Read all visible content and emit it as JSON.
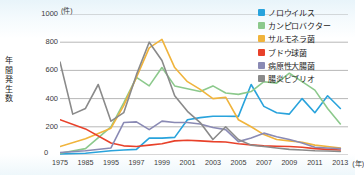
{
  "axes": {
    "y_unit": "(件)",
    "y_title": "年間発生数",
    "y_ticks": [
      "1000",
      "800",
      "600",
      "400",
      "200",
      "0"
    ],
    "x_unit": "(年)",
    "x_ticks": [
      "1975",
      "1985",
      "1995",
      "1997",
      "1999",
      "2001",
      "2003",
      "2005",
      "2007",
      "2009",
      "2011",
      "2013"
    ]
  },
  "legend": {
    "items": [
      {
        "label": "ノロウイルス",
        "color": "#29a3dc",
        "name": "norovirus"
      },
      {
        "label": "カンピロバクター",
        "color": "#8cc98c",
        "name": "campylobacter"
      },
      {
        "label": "サルモネラ菌",
        "color": "#f0b43c",
        "name": "salmonella"
      },
      {
        "label": "ブドウ球菌",
        "color": "#e8412a",
        "name": "staphylococcus"
      },
      {
        "label": "病原性大腸菌",
        "color": "#8a8ab4",
        "name": "pathogenic-ecoli"
      },
      {
        "label": "腸炎ビブリオ",
        "color": "#8a8a8a",
        "name": "vibrio"
      }
    ]
  },
  "chart_data": {
    "type": "line",
    "title": "",
    "xlabel": "(年)",
    "ylabel": "年間発生数",
    "ylim": [
      0,
      1000
    ],
    "grid": true,
    "legend_position": "top-right",
    "x": [
      "1975",
      "1985",
      "1995",
      "1997",
      "1999",
      "2001",
      "2003",
      "2005",
      "2007",
      "2009",
      "2011",
      "2013"
    ],
    "x_note": "axis ticks are unevenly spaced in time: 10-year gaps before 1995, 2-year gaps afterwards; line vertices are drawn at each tick",
    "series": [
      {
        "name": "ノロウイルス",
        "color": "#29a3dc",
        "values": [
          10,
          15,
          35,
          40,
          125,
          270,
          280,
          275,
          345,
          290,
          300,
          330
        ],
        "detail_points": [
          {
            "x": "1975",
            "y": 8
          },
          {
            "x": "1985",
            "y": 12
          },
          {
            "x": "1995",
            "y": 30
          },
          {
            "x": "1996",
            "y": 35
          },
          {
            "x": "1997",
            "y": 40
          },
          {
            "x": "1998",
            "y": 120
          },
          {
            "x": "1999",
            "y": 120
          },
          {
            "x": "2000",
            "y": 125
          },
          {
            "x": "2001",
            "y": 250
          },
          {
            "x": "2002",
            "y": 265
          },
          {
            "x": "2003",
            "y": 275
          },
          {
            "x": "2004",
            "y": 275
          },
          {
            "x": "2005",
            "y": 274
          },
          {
            "x": "2006",
            "y": 500
          },
          {
            "x": "2007",
            "y": 345
          },
          {
            "x": "2008",
            "y": 300
          },
          {
            "x": "2009",
            "y": 290
          },
          {
            "x": "2010",
            "y": 400
          },
          {
            "x": "2011",
            "y": 300
          },
          {
            "x": "2012",
            "y": 420
          },
          {
            "x": "2013",
            "y": 330
          }
        ]
      },
      {
        "name": "カンピロバクター",
        "color": "#8cc98c",
        "values": [
          15,
          40,
          200,
          370,
          620,
          470,
          490,
          430,
          520,
          580,
          460,
          220
        ],
        "detail_points": [
          {
            "x": "1975",
            "y": 12
          },
          {
            "x": "1985",
            "y": 45
          },
          {
            "x": "1995",
            "y": 200
          },
          {
            "x": "1996",
            "y": 370
          },
          {
            "x": "1997",
            "y": 550
          },
          {
            "x": "1998",
            "y": 490
          },
          {
            "x": "1999",
            "y": 620
          },
          {
            "x": "2000",
            "y": 490
          },
          {
            "x": "2001",
            "y": 470
          },
          {
            "x": "2002",
            "y": 450
          },
          {
            "x": "2003",
            "y": 490
          },
          {
            "x": "2004",
            "y": 440
          },
          {
            "x": "2005",
            "y": 430
          },
          {
            "x": "2006",
            "y": 450
          },
          {
            "x": "2007",
            "y": 520
          },
          {
            "x": "2008",
            "y": 510
          },
          {
            "x": "2009",
            "y": 580
          },
          {
            "x": "2010",
            "y": 520
          },
          {
            "x": "2011",
            "y": 460
          },
          {
            "x": "2012",
            "y": 330
          },
          {
            "x": "2013",
            "y": 220
          }
        ]
      },
      {
        "name": "サルモネラ菌",
        "color": "#f0b43c",
        "values": [
          60,
          110,
          190,
          550,
          820,
          520,
          400,
          250,
          145,
          100,
          70,
          50
        ],
        "detail_points": [
          {
            "x": "1975",
            "y": 60
          },
          {
            "x": "1985",
            "y": 115
          },
          {
            "x": "1995",
            "y": 190
          },
          {
            "x": "1996",
            "y": 350
          },
          {
            "x": "1997",
            "y": 550
          },
          {
            "x": "1998",
            "y": 760
          },
          {
            "x": "1999",
            "y": 820
          },
          {
            "x": "2000",
            "y": 620
          },
          {
            "x": "2001",
            "y": 520
          },
          {
            "x": "2002",
            "y": 465
          },
          {
            "x": "2003",
            "y": 400
          },
          {
            "x": "2004",
            "y": 410
          },
          {
            "x": "2005",
            "y": 250
          },
          {
            "x": "2006",
            "y": 200
          },
          {
            "x": "2007",
            "y": 145
          },
          {
            "x": "2008",
            "y": 110
          },
          {
            "x": "2009",
            "y": 100
          },
          {
            "x": "2010",
            "y": 90
          },
          {
            "x": "2011",
            "y": 70
          },
          {
            "x": "2012",
            "y": 60
          },
          {
            "x": "2013",
            "y": 50
          }
        ]
      },
      {
        "name": "ブドウ球菌",
        "color": "#e8412a",
        "values": [
          250,
          185,
          85,
          60,
          80,
          105,
          95,
          80,
          65,
          60,
          45,
          35
        ],
        "detail_points": [
          {
            "x": "1975",
            "y": 250
          },
          {
            "x": "1985",
            "y": 185
          },
          {
            "x": "1995",
            "y": 85
          },
          {
            "x": "1996",
            "y": 65
          },
          {
            "x": "1997",
            "y": 60
          },
          {
            "x": "1998",
            "y": 70
          },
          {
            "x": "1999",
            "y": 80
          },
          {
            "x": "2000",
            "y": 100
          },
          {
            "x": "2001",
            "y": 105
          },
          {
            "x": "2002",
            "y": 100
          },
          {
            "x": "2003",
            "y": 95
          },
          {
            "x": "2004",
            "y": 92
          },
          {
            "x": "2005",
            "y": 80
          },
          {
            "x": "2006",
            "y": 72
          },
          {
            "x": "2007",
            "y": 65
          },
          {
            "x": "2008",
            "y": 62
          },
          {
            "x": "2009",
            "y": 60
          },
          {
            "x": "2010",
            "y": 55
          },
          {
            "x": "2011",
            "y": 45
          },
          {
            "x": "2012",
            "y": 40
          },
          {
            "x": "2013",
            "y": 35
          }
        ]
      },
      {
        "name": "病原性大腸菌",
        "color": "#8a8ab4",
        "values": [
          20,
          30,
          50,
          230,
          240,
          230,
          195,
          95,
          155,
          110,
          55,
          45
        ],
        "detail_points": [
          {
            "x": "1975",
            "y": 18
          },
          {
            "x": "1985",
            "y": 30
          },
          {
            "x": "1995",
            "y": 50
          },
          {
            "x": "1996",
            "y": 230
          },
          {
            "x": "1997",
            "y": 235
          },
          {
            "x": "1998",
            "y": 180
          },
          {
            "x": "1999",
            "y": 240
          },
          {
            "x": "2000",
            "y": 230
          },
          {
            "x": "2001",
            "y": 230
          },
          {
            "x": "2002",
            "y": 220
          },
          {
            "x": "2003",
            "y": 195
          },
          {
            "x": "2004",
            "y": 180
          },
          {
            "x": "2005",
            "y": 95
          },
          {
            "x": "2006",
            "y": 120
          },
          {
            "x": "2007",
            "y": 155
          },
          {
            "x": "2008",
            "y": 130
          },
          {
            "x": "2009",
            "y": 110
          },
          {
            "x": "2010",
            "y": 85
          },
          {
            "x": "2011",
            "y": 55
          },
          {
            "x": "2012",
            "y": 50
          },
          {
            "x": "2013",
            "y": 45
          }
        ]
      },
      {
        "name": "腸炎ビブリオ",
        "color": "#8a8a8a",
        "values": [
          660,
          330,
          240,
          570,
          800,
          310,
          110,
          110,
          60,
          40,
          30,
          25
        ],
        "detail_points": [
          {
            "x": "1975",
            "y": 660
          },
          {
            "x": "1980",
            "y": 290
          },
          {
            "x": "1985",
            "y": 330
          },
          {
            "x": "1990",
            "y": 500
          },
          {
            "x": "1995",
            "y": 240
          },
          {
            "x": "1996",
            "y": 300
          },
          {
            "x": "1997",
            "y": 570
          },
          {
            "x": "1998",
            "y": 800
          },
          {
            "x": "1999",
            "y": 670
          },
          {
            "x": "2000",
            "y": 420
          },
          {
            "x": "2001",
            "y": 310
          },
          {
            "x": "2002",
            "y": 230
          },
          {
            "x": "2003",
            "y": 110
          },
          {
            "x": "2004",
            "y": 200
          },
          {
            "x": "2005",
            "y": 110
          },
          {
            "x": "2006",
            "y": 70
          },
          {
            "x": "2007",
            "y": 60
          },
          {
            "x": "2008",
            "y": 50
          },
          {
            "x": "2009",
            "y": 40
          },
          {
            "x": "2010",
            "y": 35
          },
          {
            "x": "2011",
            "y": 30
          },
          {
            "x": "2012",
            "y": 28
          },
          {
            "x": "2013",
            "y": 25
          }
        ]
      }
    ]
  }
}
